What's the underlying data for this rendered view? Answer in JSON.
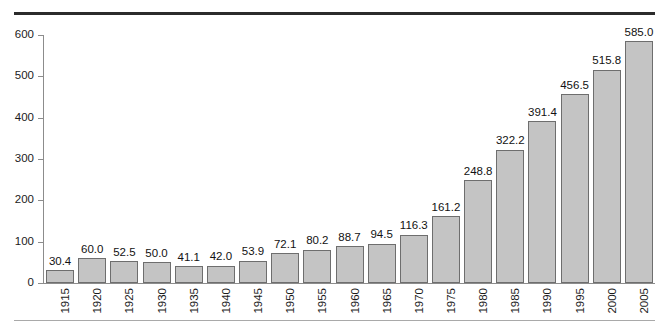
{
  "chart_data": {
    "type": "bar",
    "title": "",
    "subtitle": "",
    "xlabel": "",
    "ylabel": "",
    "categories": [
      "1915",
      "1920",
      "1925",
      "1930",
      "1935",
      "1940",
      "1945",
      "1950",
      "1955",
      "1960",
      "1965",
      "1970",
      "1975",
      "1980",
      "1985",
      "1990",
      "1995",
      "2000",
      "2005"
    ],
    "values": [
      30.4,
      60.0,
      52.5,
      50.0,
      41.1,
      42.0,
      53.9,
      72.1,
      80.2,
      88.7,
      94.5,
      116.3,
      161.2,
      248.8,
      322.2,
      391.4,
      456.5,
      515.8,
      585.0
    ],
    "data_labels": [
      "30.4",
      "60.0",
      "52.5",
      "50.0",
      "41.1",
      "42.0",
      "53.9",
      "72.1",
      "80.2",
      "88.7",
      "94.5",
      "116.3",
      "161.2",
      "248.8",
      "322.2",
      "391.4",
      "456.5",
      "515.8",
      "585.0"
    ],
    "ylim": [
      0,
      600
    ],
    "ytick_values": [
      0,
      100,
      200,
      300,
      400,
      500,
      600
    ],
    "ytick_labels": [
      "0",
      "100",
      "200",
      "300",
      "400",
      "500",
      "600"
    ],
    "grid": false,
    "legend": null,
    "legend_position": "none",
    "colors": {
      "bar_fill": "#c4c4c4",
      "bar_edge": "#6e6e6e",
      "axis": "#8c8c8c",
      "text": "#1b1b1b",
      "rule_top": "#2b2b2b",
      "rule_bottom": "#a9a9a9",
      "background": "#ffffff"
    }
  }
}
